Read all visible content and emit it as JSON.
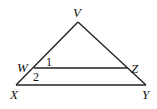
{
  "diagram": {
    "type": "triangle-with-parallel-segment",
    "points": {
      "V": {
        "label": "V",
        "x": 78,
        "y": 22
      },
      "W": {
        "label": "W",
        "x": 34,
        "y": 68
      },
      "Z": {
        "label": "Z",
        "x": 127,
        "y": 68
      },
      "X": {
        "label": "X",
        "x": 16,
        "y": 85
      },
      "Y": {
        "label": "Y",
        "x": 146,
        "y": 85
      }
    },
    "segments": [
      "VX",
      "VY",
      "XY",
      "WZ"
    ],
    "angles": [
      {
        "label": "1",
        "at": "W",
        "between": [
          "WV",
          "WZ"
        ]
      },
      {
        "label": "2",
        "at": "W",
        "between": [
          "WZ",
          "WX"
        ]
      }
    ]
  }
}
